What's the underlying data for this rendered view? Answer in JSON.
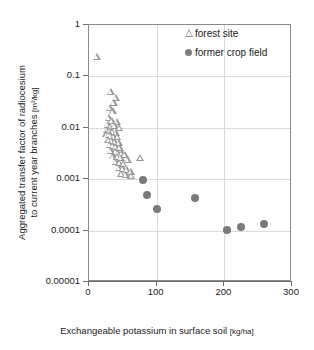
{
  "chart_data": {
    "type": "scatter",
    "title": "",
    "xlabel": "Exchangeable potassium in surface soil [kg/ha]",
    "xlabel_main": "Exchangeable potassium in surface soil",
    "xlabel_unit": "[kg/ha]",
    "ylabel": "Aggregated transfer factor of radiocesium to current year branches [m2/kg]",
    "ylabel_line1": "Aggregated transfer factor of radiocesium",
    "ylabel_line2": "to current year branches",
    "ylabel_unit": "[m²/kg]",
    "xscale": "linear",
    "yscale": "log",
    "xlim": [
      0,
      300
    ],
    "ylim": [
      1e-05,
      1
    ],
    "grid": true,
    "legend_position": "top-right",
    "xticks": [
      0,
      100,
      200,
      300
    ],
    "xticklabels": [
      "0",
      "100",
      "200",
      "300"
    ],
    "yticks": [
      1,
      0.1,
      0.01,
      0.001,
      0.0001,
      1e-05
    ],
    "yticklabels": [
      "1",
      "0.1",
      "0.01",
      "0.001",
      "0.0001",
      "0.00001"
    ],
    "series": [
      {
        "name": "forest site",
        "marker": "open-triangle",
        "color": "#9a9a9a",
        "points": [
          [
            12,
            0.24
          ],
          [
            33,
            0.05
          ],
          [
            40,
            0.038
          ],
          [
            31,
            0.025
          ],
          [
            37,
            0.031
          ],
          [
            36,
            0.021
          ],
          [
            30,
            0.016
          ],
          [
            34,
            0.014
          ],
          [
            41,
            0.013
          ],
          [
            28,
            0.0115
          ],
          [
            32,
            0.0105
          ],
          [
            38,
            0.0108
          ],
          [
            45,
            0.0102
          ],
          [
            27,
            0.0092
          ],
          [
            31,
            0.0088
          ],
          [
            35,
            0.0085
          ],
          [
            40,
            0.008
          ],
          [
            26,
            0.0075
          ],
          [
            30,
            0.0072
          ],
          [
            33,
            0.007
          ],
          [
            37,
            0.0068
          ],
          [
            42,
            0.0066
          ],
          [
            29,
            0.0058
          ],
          [
            34,
            0.0056
          ],
          [
            38,
            0.0054
          ],
          [
            44,
            0.0052
          ],
          [
            31,
            0.0046
          ],
          [
            36,
            0.0044
          ],
          [
            40,
            0.0043
          ],
          [
            46,
            0.0041
          ],
          [
            33,
            0.0036
          ],
          [
            39,
            0.0034
          ],
          [
            43,
            0.0033
          ],
          [
            49,
            0.0032
          ],
          [
            36,
            0.0028
          ],
          [
            42,
            0.0027
          ],
          [
            47,
            0.0026
          ],
          [
            53,
            0.003
          ],
          [
            40,
            0.0022
          ],
          [
            45,
            0.0021
          ],
          [
            51,
            0.002
          ],
          [
            58,
            0.0024
          ],
          [
            44,
            0.0017
          ],
          [
            50,
            0.0016
          ],
          [
            56,
            0.0015
          ],
          [
            62,
            0.0014
          ],
          [
            48,
            0.0013
          ],
          [
            55,
            0.0012
          ],
          [
            63,
            0.00115
          ],
          [
            76,
            0.0026
          ]
        ]
      },
      {
        "name": "former crop field",
        "marker": "filled-circle",
        "color": "#7a7a7a",
        "points": [
          [
            80,
            0.00095
          ],
          [
            86,
            0.00049
          ],
          [
            100,
            0.00026
          ],
          [
            157,
            0.00043
          ],
          [
            204,
            0.000105
          ],
          [
            225,
            0.00012
          ],
          [
            258,
            0.000133
          ]
        ]
      }
    ]
  },
  "legend": {
    "items": [
      {
        "label": "forest site",
        "marker": "open-triangle"
      },
      {
        "label": "former crop field",
        "marker": "filled-circle"
      }
    ]
  }
}
